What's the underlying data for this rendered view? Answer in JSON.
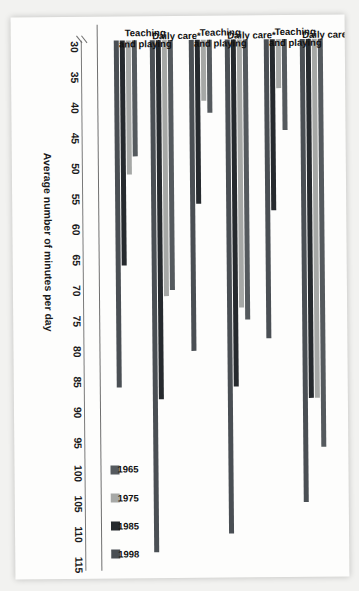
{
  "chart_data": {
    "type": "bar",
    "title": "",
    "xlabel": "",
    "ylabel": "Average number of minutes per day",
    "ylim": [
      30,
      115
    ],
    "axis_break": true,
    "grid": false,
    "legend_position": "bottom-right",
    "tick_labels": [
      "30",
      "35",
      "40",
      "45",
      "50",
      "55",
      "60",
      "65",
      "70",
      "75",
      "80",
      "85",
      "90",
      "95",
      "100",
      "105",
      "110",
      "115"
    ],
    "tick_values": [
      30,
      35,
      40,
      45,
      50,
      55,
      60,
      65,
      70,
      75,
      80,
      85,
      90,
      95,
      100,
      105,
      110,
      115
    ],
    "legend": [
      "1965",
      "1975",
      "1985",
      "1998"
    ],
    "series_colors": [
      "#555a5e",
      "#a6a8a6",
      "#262a2e",
      "#4a4f54"
    ],
    "group_labels": [
      "All mothers",
      "Married mothers",
      "Single mothers"
    ],
    "categories": [
      "Daily care*",
      "Teaching and playing",
      "Daily care*",
      "Teaching and playing",
      "Daily care*",
      "Teaching and playing"
    ],
    "groups": [
      {
        "group": "All mothers",
        "categories": [
          {
            "name": "Daily care*",
            "series": [
              {
                "name": "1965",
                "value": 96
              },
              {
                "name": "1975",
                "value": 88
              },
              {
                "name": "1985",
                "value": 88
              },
              {
                "name": "1998",
                "value": 105
              }
            ]
          },
          {
            "name": "Teaching and playing",
            "series": [
              {
                "name": "1965",
                "value": 44
              },
              {
                "name": "1975",
                "value": 37
              },
              {
                "name": "1985",
                "value": 57
              },
              {
                "name": "1998",
                "value": 78
              }
            ]
          }
        ]
      },
      {
        "group": "Married mothers",
        "categories": [
          {
            "name": "Daily care*",
            "series": [
              {
                "name": "1965",
                "value": 75
              },
              {
                "name": "1975",
                "value": 73
              },
              {
                "name": "1985",
                "value": 86
              },
              {
                "name": "1998",
                "value": 110
              }
            ]
          },
          {
            "name": "Teaching and playing",
            "series": [
              {
                "name": "1965",
                "value": 41
              },
              {
                "name": "1975",
                "value": 39
              },
              {
                "name": "1985",
                "value": 56
              },
              {
                "name": "1998",
                "value": 80
              }
            ]
          }
        ]
      },
      {
        "group": "Single mothers",
        "categories": [
          {
            "name": "Daily care*",
            "series": [
              {
                "name": "1965",
                "value": 70
              },
              {
                "name": "1975",
                "value": 71
              },
              {
                "name": "1985",
                "value": 88
              },
              {
                "name": "1998",
                "value": 113
              }
            ]
          },
          {
            "name": "Teaching and playing",
            "series": [
              {
                "name": "1965",
                "value": 48
              },
              {
                "name": "1975",
                "value": 51
              },
              {
                "name": "1985",
                "value": 66
              },
              {
                "name": "1998",
                "value": 86
              }
            ]
          }
        ]
      }
    ]
  }
}
